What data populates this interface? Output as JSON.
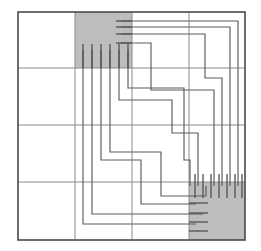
{
  "figure": {
    "type": "floorplan-routing-diagram",
    "width": 261,
    "height": 251,
    "background_color": "#ffffff"
  },
  "colors": {
    "macro_fill": "#bdbdbd",
    "grid_stroke": "#8a8a8a",
    "frame_stroke": "#4a4a4a",
    "wire_stroke": "#5c5c5c",
    "pin_stroke": "#4f4f4f"
  },
  "frame": {
    "x": 18,
    "y": 12,
    "width": 227,
    "height": 228,
    "stroke_width": 1.6
  },
  "grid": {
    "columns": 4,
    "rows": 4,
    "vertical_lines_x": [
      75,
      132,
      189
    ],
    "horizontal_lines_y": [
      68,
      125,
      182
    ],
    "stroke_width": 1
  },
  "macro_blocks": [
    {
      "name": "block-top-left",
      "label": "A",
      "x": 75,
      "y": 12,
      "width": 57,
      "height": 56,
      "fill": "#bdbdbd",
      "pin_edges": [
        "bottom",
        "right"
      ],
      "bottom_pin_count": 6,
      "right_pin_count": 4
    },
    {
      "name": "block-bottom-right",
      "label": "B",
      "x": 189,
      "y": 182,
      "width": 56,
      "height": 58,
      "fill": "#bdbdbd",
      "pin_edges": [
        "top",
        "left"
      ],
      "top_pin_count": 7,
      "left_pin_count": 4
    }
  ],
  "pins": {
    "top_left_bottom": [
      {
        "name": "pin-A-b1",
        "x": 83,
        "y": 44,
        "y2": 68
      },
      {
        "name": "pin-A-b2",
        "x": 92,
        "y": 44,
        "y2": 68
      },
      {
        "name": "pin-A-b3",
        "x": 101,
        "y": 44,
        "y2": 68
      },
      {
        "name": "pin-A-b4",
        "x": 110,
        "y": 44,
        "y2": 68
      },
      {
        "name": "pin-A-b5",
        "x": 119,
        "y": 44,
        "y2": 68
      },
      {
        "name": "pin-A-b6",
        "x": 128,
        "y": 44,
        "y2": 68
      }
    ],
    "top_left_right": [
      {
        "name": "pin-A-r1",
        "x": 116,
        "x2": 132,
        "y": 21
      },
      {
        "name": "pin-A-r2",
        "x": 116,
        "x2": 132,
        "y": 27
      },
      {
        "name": "pin-A-r3",
        "x": 116,
        "x2": 132,
        "y": 34
      },
      {
        "name": "pin-A-r4",
        "x": 116,
        "x2": 132,
        "y": 43
      }
    ],
    "bottom_right_top": [
      {
        "name": "pin-B-t1",
        "x": 195,
        "y": 174,
        "y2": 198
      },
      {
        "name": "pin-B-t2",
        "x": 203,
        "y": 174,
        "y2": 198
      },
      {
        "name": "pin-B-t3",
        "x": 211,
        "y": 174,
        "y2": 198
      },
      {
        "name": "pin-B-t4",
        "x": 219,
        "y": 174,
        "y2": 198
      },
      {
        "name": "pin-B-t5",
        "x": 227,
        "y": 174,
        "y2": 198
      },
      {
        "name": "pin-B-t6",
        "x": 235,
        "y": 174,
        "y2": 198
      },
      {
        "name": "pin-B-t7",
        "x": 242,
        "y": 174,
        "y2": 198
      }
    ],
    "bottom_right_left": [
      {
        "name": "pin-B-l1",
        "x": 189,
        "x2": 208,
        "y": 203
      },
      {
        "name": "pin-B-l2",
        "x": 189,
        "x2": 208,
        "y": 213
      },
      {
        "name": "pin-B-l3",
        "x": 189,
        "x2": 208,
        "y": 222
      },
      {
        "name": "pin-B-l4",
        "x": 189,
        "x2": 208,
        "y": 231
      }
    ]
  },
  "wires": [
    {
      "name": "wire-1",
      "points": "121,21 238,21 238,186"
    },
    {
      "name": "wire-2",
      "points": "121,27 230,27 230,186"
    },
    {
      "name": "wire-3",
      "points": "121,34 205,34 205,78 222,78 222,186"
    },
    {
      "name": "wire-4",
      "points": "121,43 151,43 151,90 214,90 214,186"
    },
    {
      "name": "wire-5",
      "points": "83,50 83,224 196,224"
    },
    {
      "name": "wire-6",
      "points": "92,50 92,214 203,214"
    },
    {
      "name": "wire-7",
      "points": "101,50 101,160 141,160 141,204 196,204"
    },
    {
      "name": "wire-8",
      "points": "110,50 110,152 161,152 161,196 206,196 206,186"
    },
    {
      "name": "wire-9",
      "points": "119,50 119,100 172,100 172,133 198,133 198,186"
    },
    {
      "name": "wire-10",
      "points": "128,50 128,88 184,88 184,160 190,160 190,186"
    }
  ],
  "legend": {
    "block_a_description": "Macro block A (top-left), shaded",
    "block_b_description": "Macro block B (bottom-right), shaded",
    "wire_description": "Orthogonal routed nets",
    "grid_description": "4 by 4 global routing grid"
  }
}
